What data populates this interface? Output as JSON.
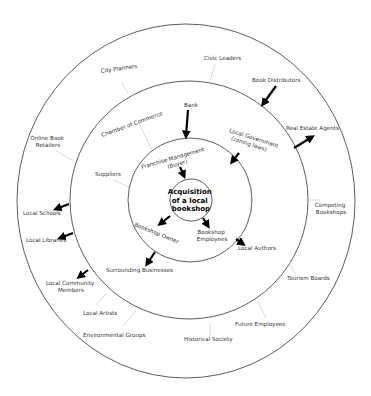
{
  "diagram": {
    "type": "stakeholder-onion-diagram",
    "center": {
      "lines": [
        "Acquisition",
        "of a local",
        "bookshop"
      ]
    },
    "rings": {
      "outer": {
        "name": "outer ring"
      },
      "middle": {
        "name": "middle ring"
      },
      "inner": {
        "name": "inner ring"
      }
    },
    "labels": {
      "civic_leaders": "Civic Leaders",
      "city_planners": "City Planners",
      "book_distributors": "Book Distributors",
      "bank": "Bank",
      "chamber_of_commerce": "Chamber of Commerce",
      "local_government_1": "Local Government",
      "local_government_2": "(zoning laws)",
      "real_estate_agents": "Real Estate Agents",
      "online_book_retailers_1": "Online Book",
      "online_book_retailers_2": "Retailers",
      "suppliers": "Suppliers",
      "franchise_management_1": "Franchise Management",
      "franchise_management_2": "(Buyer)",
      "competing_bookshops_1": "Competing",
      "competing_bookshops_2": "Bookshops",
      "local_schools": "Local Schools",
      "local_libraries": "Local Libraries",
      "bookshop_owner": "Bookshop Owner",
      "bookshop_employees_1": "Bookshop",
      "bookshop_employees_2": "Employees",
      "local_authors": "Local Authors",
      "surrounding_businesses": "Surrounding Businesses",
      "tourism_boards": "Tourism Boards",
      "local_community_members_1": "Local Community",
      "local_community_members_2": "Members",
      "local_artists": "Local Artists",
      "future_employees": "Future Employees",
      "environmental_groups": "Environmental Groups",
      "historical_society": "Historical Society"
    }
  }
}
